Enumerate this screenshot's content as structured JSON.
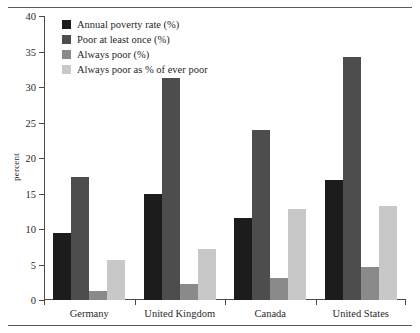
{
  "chart_data": {
    "type": "bar",
    "title": "",
    "xlabel": "",
    "ylabel": "percent",
    "ylim": [
      0,
      40
    ],
    "ytick_step": 5,
    "grid": false,
    "legend_position": "top-left",
    "categories": [
      "Germany",
      "United Kingdom",
      "Canada",
      "United States"
    ],
    "series": [
      {
        "name": "Annual poverty rate (%)",
        "color": "#1c1c1c",
        "values": [
          9.5,
          15.0,
          11.5,
          16.9
        ]
      },
      {
        "name": "Poor at least once (%)",
        "color": "#4d4d4d",
        "values": [
          17.3,
          31.2,
          23.9,
          34.2
        ]
      },
      {
        "name": "Always poor (%)",
        "color": "#8a8a8a",
        "values": [
          1.2,
          2.3,
          3.1,
          4.7
        ]
      },
      {
        "name": "Always poor as % of ever poor",
        "color": "#c8c8c8",
        "values": [
          5.7,
          7.2,
          12.8,
          13.3
        ]
      }
    ],
    "ytick_labels": [
      "0",
      "5",
      "10",
      "15",
      "20",
      "25",
      "30",
      "35",
      "40"
    ]
  }
}
